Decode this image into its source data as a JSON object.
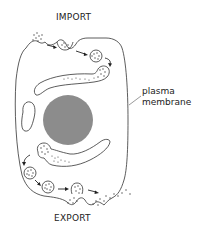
{
  "labels": {
    "import": "IMPORT",
    "export": "EXPORT",
    "plasma_membrane_line1": "plasma",
    "plasma_membrane_line2": "membrane"
  },
  "colors": {
    "outline": "#333333",
    "nucleus": "#8c8c8c",
    "cargo_dots": "#444444",
    "background": "#ffffff"
  },
  "structures": [
    "plasma-membrane",
    "nucleus",
    "upper-curved-compartment",
    "lower-curved-compartment",
    "left-small-compartment",
    "import-vesicles",
    "export-vesicles"
  ]
}
